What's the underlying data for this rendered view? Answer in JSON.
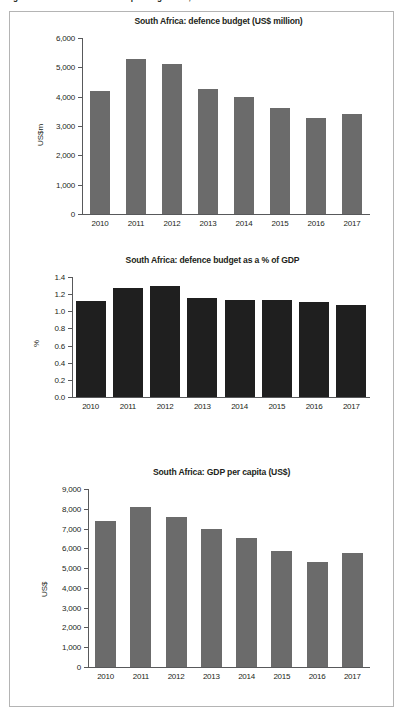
{
  "figure": {
    "caption": "Figure 4: South Africa: defence spending trends, 2010–2017",
    "border_color": "#b4b4b4",
    "background": "#ffffff"
  },
  "chart_data": [
    {
      "type": "bar",
      "title": "South Africa: defence budget (US$ million)",
      "xlabel": "",
      "ylabel": "US$m",
      "categories": [
        "2010",
        "2011",
        "2012",
        "2013",
        "2014",
        "2015",
        "2016",
        "2017"
      ],
      "values": [
        4200,
        5300,
        5100,
        4250,
        4000,
        3600,
        3280,
        3420
      ],
      "ylim": [
        0,
        6000
      ],
      "ytick_step": 1000,
      "ytick_labels": [
        "0",
        "1,000",
        "2,000",
        "3,000",
        "4,000",
        "5,000",
        "6,000"
      ],
      "bar_color": "#6b6b6b",
      "grid": false,
      "legend": "none"
    },
    {
      "type": "bar",
      "title": "South Africa: defence budget as a % of GDP",
      "xlabel": "",
      "ylabel": "%",
      "categories": [
        "2010",
        "2011",
        "2012",
        "2013",
        "2014",
        "2015",
        "2016",
        "2017"
      ],
      "values": [
        1.12,
        1.27,
        1.29,
        1.16,
        1.13,
        1.13,
        1.11,
        1.07
      ],
      "ylim": [
        0.0,
        1.4
      ],
      "ytick_step": 0.2,
      "ytick_labels": [
        "0.0",
        "0.2",
        "0.4",
        "0.6",
        "0.8",
        "1.0",
        "1.2",
        "1.4"
      ],
      "bar_color": "#1f1f1f",
      "grid": false,
      "legend": "none"
    },
    {
      "type": "bar",
      "title": "South Africa: GDP per capita (US$)",
      "xlabel": "",
      "ylabel": "US$",
      "categories": [
        "2010",
        "2011",
        "2012",
        "2013",
        "2014",
        "2015",
        "2016",
        "2017"
      ],
      "values": [
        7370,
        8100,
        7580,
        7000,
        6500,
        5870,
        5320,
        5780
      ],
      "ylim": [
        0,
        9000
      ],
      "ytick_step": 1000,
      "ytick_labels": [
        "0",
        "1,000",
        "2,000",
        "3,000",
        "4,000",
        "5,000",
        "6,000",
        "7,000",
        "8,000",
        "9,000"
      ],
      "bar_color": "#6b6b6b",
      "grid": false,
      "legend": "none"
    }
  ]
}
